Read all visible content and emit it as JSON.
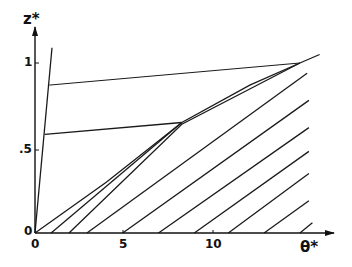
{
  "chart_data": {
    "type": "line",
    "title": "",
    "xlabel": "θ*",
    "ylabel": "z*",
    "xlim": [
      0,
      16
    ],
    "ylim": [
      0,
      1.1
    ],
    "grid": false,
    "legend": null,
    "x_ticks": [
      {
        "value": 0,
        "label": "0"
      },
      {
        "value": 5,
        "label": "5"
      },
      {
        "value": 10,
        "label": "10"
      }
    ],
    "y_ticks": [
      {
        "value": 0,
        "label": "0"
      },
      {
        "value": 0.5,
        "label": ".5"
      },
      {
        "value": 1,
        "label": "1"
      }
    ],
    "series": [
      {
        "name": "steep-line",
        "points": [
          [
            0,
            0
          ],
          [
            0.95,
            1.09
          ]
        ]
      },
      {
        "name": "upper-horizontal",
        "points": [
          [
            0.8,
            0.87
          ],
          [
            14.8,
            1.0
          ]
        ]
      },
      {
        "name": "lower-horizontal",
        "points": [
          [
            0.55,
            0.58
          ],
          [
            8.2,
            0.65
          ]
        ]
      },
      {
        "name": "envelope",
        "points": [
          [
            0,
            0
          ],
          [
            4,
            0.3
          ],
          [
            8.2,
            0.65
          ],
          [
            12,
            0.87
          ],
          [
            14.8,
            1.0
          ],
          [
            15.9,
            1.05
          ]
        ]
      },
      {
        "name": "characteristic-1",
        "points": [
          [
            0.9,
            0
          ],
          [
            8.2,
            0.65
          ]
        ]
      },
      {
        "name": "characteristic-2",
        "points": [
          [
            1.9,
            0
          ],
          [
            8.2,
            0.64
          ],
          [
            14.8,
            1.0
          ]
        ]
      },
      {
        "name": "characteristic-3",
        "points": [
          [
            2.9,
            0
          ],
          [
            15.2,
            0.94
          ]
        ]
      },
      {
        "name": "characteristic-4",
        "points": [
          [
            4.9,
            0
          ],
          [
            15.3,
            0.78
          ]
        ]
      },
      {
        "name": "characteristic-5",
        "points": [
          [
            6.9,
            0
          ],
          [
            15.3,
            0.62
          ]
        ]
      },
      {
        "name": "characteristic-6",
        "points": [
          [
            8.9,
            0
          ],
          [
            15.3,
            0.48
          ]
        ]
      },
      {
        "name": "characteristic-7",
        "points": [
          [
            10.8,
            0
          ],
          [
            15.3,
            0.35
          ]
        ]
      },
      {
        "name": "characteristic-8",
        "points": [
          [
            12.8,
            0
          ],
          [
            15.3,
            0.19
          ]
        ]
      },
      {
        "name": "characteristic-9",
        "points": [
          [
            14.8,
            0
          ],
          [
            15.5,
            0.06
          ]
        ]
      }
    ]
  },
  "labels": {
    "x_axis_title": "θ*",
    "y_axis_title": "z*",
    "x_tick_0": "0",
    "x_tick_5": "5",
    "x_tick_10": "10",
    "y_tick_0": "0",
    "y_tick_05": ".5",
    "y_tick_1": "1"
  }
}
